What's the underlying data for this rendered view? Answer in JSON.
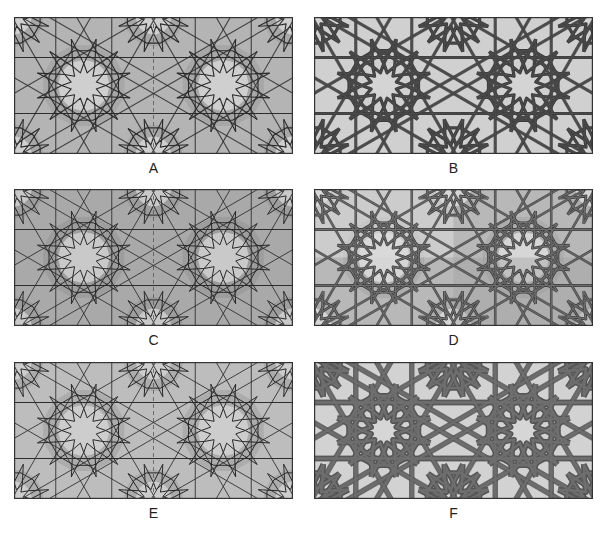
{
  "figure": {
    "panels": [
      {
        "id": "A",
        "label": "A",
        "x": 14,
        "y": 17,
        "bg": "#b4b4b4",
        "fill_light": "#cfcfcf",
        "fill_dark": "#9c9c9c",
        "stroke": "#2a2a2a",
        "stroke_width": 1.1,
        "style": "line-with-tiles",
        "center_axis": "dashed"
      },
      {
        "id": "B",
        "label": "B",
        "x": 314,
        "y": 17,
        "bg": "#d0d0d0",
        "fill_light": "#d4d4d4",
        "fill_dark": "#d4d4d4",
        "stroke": "#3c3c3c",
        "stroke_width": 3.2,
        "style": "thick-strapwork",
        "center_axis": "none"
      },
      {
        "id": "C",
        "label": "C",
        "x": 14,
        "y": 189,
        "bg": "#a9a9a9",
        "fill_light": "#c9c9c9",
        "fill_dark": "#939393",
        "stroke": "#2a2a2a",
        "stroke_width": 1.0,
        "style": "dense-lines",
        "center_axis": "dashed"
      },
      {
        "id": "D",
        "label": "D",
        "x": 314,
        "y": 189,
        "bg": "#b8b8b8",
        "fill_light": "#d6d6d6",
        "fill_dark": "#a4a4a4",
        "stroke": "#3a3a3a",
        "stroke_width": 2.6,
        "style": "interlaced-double",
        "center_axis": "none"
      },
      {
        "id": "E",
        "label": "E",
        "x": 14,
        "y": 362,
        "bg": "#bdbdbd",
        "fill_light": "#cdcdcd",
        "fill_dark": "#9e9e9e",
        "stroke": "#2a2a2a",
        "stroke_width": 1.0,
        "style": "line-with-tiles",
        "center_axis": "dashed"
      },
      {
        "id": "F",
        "label": "F",
        "x": 314,
        "y": 362,
        "bg": "#d2d2d2",
        "fill_light": "#d6d6d6",
        "fill_dark": "#d6d6d6",
        "stroke": "#555555",
        "stroke_width": 5.5,
        "style": "wide-interlace",
        "center_axis": "none"
      }
    ],
    "rosette_centers_relative": [
      [
        0.25,
        0.5
      ],
      [
        0.75,
        0.5
      ]
    ],
    "labels_y_offset": 143
  }
}
